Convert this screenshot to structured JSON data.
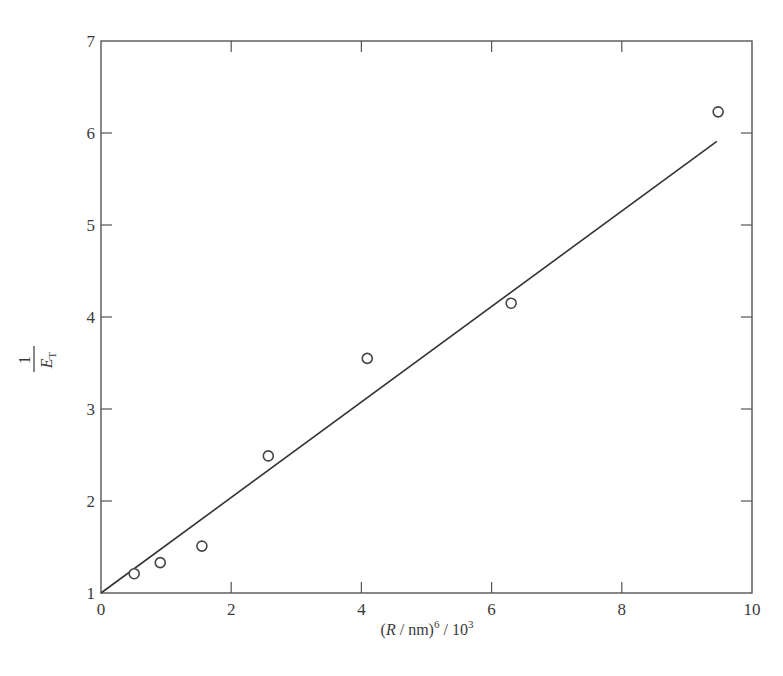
{
  "chart_data": {
    "type": "scatter",
    "title": "",
    "xlabel": "(R / nm)^6 / 10^3",
    "xlabel_parts": {
      "open": "(",
      "var": "R",
      "slash": " / nm)",
      "exp": "6",
      "tail": " / 10",
      "tail_exp": "3"
    },
    "ylabel": "1/E_T",
    "ylabel_parts": {
      "num": "1",
      "var": "E",
      "sub": "T"
    },
    "xlim": [
      0,
      10
    ],
    "ylim": [
      1,
      7
    ],
    "xticks": [
      0,
      2,
      4,
      6,
      8,
      10
    ],
    "yticks": [
      1,
      2,
      3,
      4,
      5,
      6,
      7
    ],
    "grid": false,
    "legend": null,
    "series": [
      {
        "name": "measured",
        "marker": "open-circle",
        "x": [
          0.51,
          0.91,
          1.55,
          2.57,
          4.09,
          6.3,
          9.48
        ],
        "y": [
          1.21,
          1.33,
          1.51,
          2.49,
          3.55,
          4.15,
          6.23
        ]
      },
      {
        "name": "linear fit",
        "marker": "line",
        "x": [
          0,
          9.46
        ],
        "y": [
          1.0,
          5.91
        ]
      }
    ],
    "colors": {
      "axis": "#555555",
      "line": "#333333",
      "marker": "#444444"
    }
  }
}
